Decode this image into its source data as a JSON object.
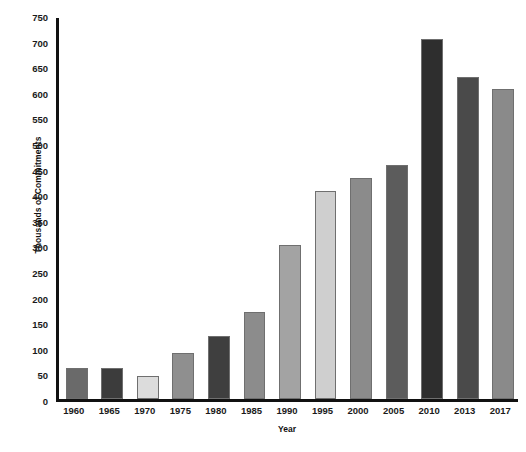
{
  "chart_data": {
    "type": "bar",
    "title": "",
    "xlabel": "Year",
    "ylabel": "Thousands of Commitments",
    "categories": [
      "1960",
      "1965",
      "1970",
      "1975",
      "1980",
      "1985",
      "1990",
      "1995",
      "2000",
      "2005",
      "2010",
      "2013",
      "2017"
    ],
    "values": [
      60,
      60,
      45,
      90,
      123,
      170,
      300,
      407,
      432,
      457,
      703,
      628,
      605
    ],
    "bar_colors": [
      "#6a6a6a",
      "#3c3c3c",
      "#dcdcdc",
      "#8f8f8f",
      "#3f3f3f",
      "#8c8c8c",
      "#a3a3a3",
      "#cfcfcf",
      "#8b8b8b",
      "#5c5c5c",
      "#2e2e2e",
      "#4a4a4a",
      "#8a8a8a"
    ],
    "ylim": [
      0,
      750
    ],
    "ytick_values": [
      0,
      50,
      100,
      150,
      200,
      250,
      300,
      350,
      400,
      450,
      500,
      550,
      600,
      650,
      700,
      750
    ],
    "ytick_labels": [
      "0",
      "50",
      "100",
      "150",
      "200",
      "250",
      "300",
      "350",
      "400",
      "450",
      "500",
      "550",
      "600",
      "650",
      "700",
      "750"
    ],
    "grid": false,
    "legend": "none"
  },
  "axis": {
    "y_title": "Thousands of Commitments",
    "x_title": "Year"
  },
  "caption": {
    "text": ""
  }
}
